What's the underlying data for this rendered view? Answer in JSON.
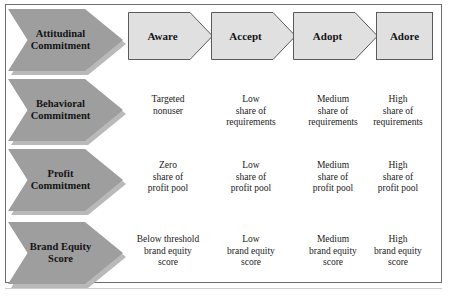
{
  "diagram": {
    "type": "matrix-funnel",
    "title": "",
    "frame": {
      "border_color": "#6e6e6e"
    },
    "colors": {
      "row_arrow_fill": "#9e9e9e",
      "row_arrow_shadow": "#b9b9b9",
      "stage_fill": "#e0e0e0",
      "stage_border": "#5a5a5a",
      "text": "#141414"
    },
    "stages": [
      {
        "label": "Aware",
        "shape": "pentagon-arrow"
      },
      {
        "label": "Accept",
        "shape": "pentagon-arrow"
      },
      {
        "label": "Adopt",
        "shape": "pentagon-arrow"
      },
      {
        "label": "Adore",
        "shape": "rectangle"
      }
    ],
    "rows": [
      {
        "label": "Attitudinal\nCommitment",
        "icon": "right-arrow-chevron",
        "cells": [
          "",
          "",
          "",
          ""
        ]
      },
      {
        "label": "Behavioral\nCommitment",
        "icon": "right-arrow-chevron",
        "cells": [
          "Targeted\nnonuser",
          "Low\nshare of\nrequirements",
          "Medium\nshare of\nrequirements",
          "High\nshare of\nrequirements"
        ]
      },
      {
        "label": "Profit\nCommitment",
        "icon": "right-arrow-chevron",
        "cells": [
          "Zero\nshare of\nprofit pool",
          "Low\nshare of\nprofit pool",
          "Medium\nshare of\nprofit pool",
          "High\nshare of\nprofit pool"
        ]
      },
      {
        "label": "Brand Equity\nScore",
        "icon": "right-arrow-chevron",
        "cells": [
          "Below threshold\nbrand equity\nscore",
          "Low\nbrand equity\nscore",
          "Medium\nbrand equity\nscore",
          "High\nbrand equity\nscore"
        ]
      }
    ]
  }
}
